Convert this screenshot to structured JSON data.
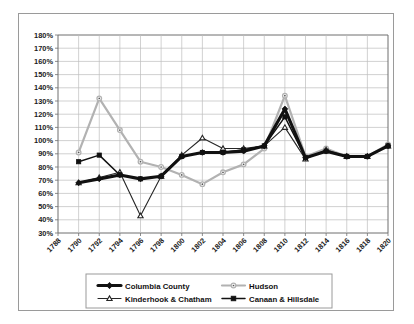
{
  "chart_data": {
    "type": "line",
    "title": "",
    "xlabel": "",
    "ylabel": "",
    "x": [
      1788,
      1790,
      1792,
      1794,
      1796,
      1798,
      1800,
      1802,
      1804,
      1806,
      1808,
      1810,
      1812,
      1814,
      1816,
      1818,
      1820
    ],
    "xtick_labels": [
      "1788",
      "1790",
      "1792",
      "1794",
      "1796",
      "1798",
      "1800",
      "1802",
      "1804",
      "1806",
      "1808",
      "1810",
      "1812",
      "1814",
      "1816",
      "1818",
      "1820"
    ],
    "ytick_labels": [
      "30%",
      "40%",
      "50%",
      "60%",
      "70%",
      "80%",
      "90%",
      "100%",
      "110%",
      "120%",
      "130%",
      "140%",
      "150%",
      "160%",
      "170%",
      "180%"
    ],
    "ytick_values": [
      30,
      40,
      50,
      60,
      70,
      80,
      90,
      100,
      110,
      120,
      130,
      140,
      150,
      160,
      170,
      180
    ],
    "ylim": [
      30,
      180
    ],
    "xlim": [
      1788,
      1820
    ],
    "grid": true,
    "legend_position": "bottom",
    "series": [
      {
        "name": "Columbia County",
        "color": "#111111",
        "marker": "diamond",
        "width": 3.1,
        "x": [
          1790,
          1792,
          1794,
          1796,
          1798,
          1800,
          1802,
          1804,
          1806,
          1808,
          1810,
          1812,
          1814,
          1816,
          1818,
          1820
        ],
        "values": [
          68,
          71,
          74,
          71,
          73,
          88,
          91,
          91,
          92,
          96,
          124,
          87,
          92,
          88,
          88,
          96
        ]
      },
      {
        "name": "Hudson",
        "color": "#b2b2b2",
        "marker": "circle",
        "width": 2.2,
        "x": [
          1790,
          1792,
          1794,
          1796,
          1798,
          1800,
          1802,
          1804,
          1806,
          1808,
          1810,
          1812,
          1814,
          1816,
          1818,
          1820
        ],
        "values": [
          91,
          132,
          108,
          84,
          80,
          74,
          67,
          76,
          82,
          94,
          134,
          88,
          94,
          88,
          88,
          97
        ]
      },
      {
        "name": "Kinderhook & Chatham",
        "color": "#262626",
        "marker": "triangle",
        "width": 1.1,
        "x": [
          1790,
          1792,
          1794,
          1796,
          1798,
          1800,
          1802,
          1804,
          1806,
          1808,
          1810,
          1812,
          1814,
          1816,
          1818,
          1820
        ],
        "values": [
          68,
          72,
          76,
          43,
          73,
          89,
          102,
          94,
          94,
          96,
          110,
          86,
          93,
          88,
          88,
          96
        ]
      },
      {
        "name": "Canaan & Hillsdale",
        "color": "#111111",
        "marker": "square",
        "width": 1.5,
        "x": [
          1790,
          1792,
          1794,
          1796,
          1798,
          1800,
          1802,
          1804,
          1806,
          1808,
          1810,
          1812,
          1814,
          1816,
          1818,
          1820
        ],
        "values": [
          84,
          89,
          74,
          71,
          73,
          88,
          91,
          91,
          93,
          96,
          118,
          87,
          92,
          88,
          88,
          96
        ]
      }
    ]
  },
  "legend": {
    "items": [
      {
        "label": "Columbia County"
      },
      {
        "label": "Hudson"
      },
      {
        "label": "Kinderhook & Chatham"
      },
      {
        "label": "Canaan & Hillsdale"
      }
    ]
  }
}
